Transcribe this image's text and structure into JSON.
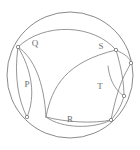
{
  "figure": {
    "shape": "circle",
    "stroke_color": "#8a8a8a",
    "label_color": "#6e6e6e",
    "background_color": "#ffffff",
    "circle": {
      "cx": 70,
      "cy": 75,
      "r": 63
    },
    "labels": [
      {
        "id": "P",
        "text": "P",
        "x": 27,
        "y": 85
      },
      {
        "id": "Q",
        "text": "Q",
        "x": 35,
        "y": 44
      },
      {
        "id": "R",
        "text": "R",
        "x": 70,
        "y": 120
      },
      {
        "id": "S",
        "text": "S",
        "x": 101,
        "y": 47
      },
      {
        "id": "T",
        "text": "T",
        "x": 100,
        "y": 87
      }
    ],
    "vertices": [
      {
        "id": "vertex-top-left",
        "x": 18,
        "y": 47
      },
      {
        "id": "vertex-top-right",
        "x": 116,
        "y": 50
      },
      {
        "id": "vertex-upper-right-outer",
        "x": 131,
        "y": 63
      },
      {
        "id": "vertex-mid-right",
        "x": 124,
        "y": 96
      },
      {
        "id": "vertex-bottom-left",
        "x": 27,
        "y": 117
      },
      {
        "id": "vertex-bottom-right",
        "x": 111,
        "y": 120
      }
    ]
  }
}
